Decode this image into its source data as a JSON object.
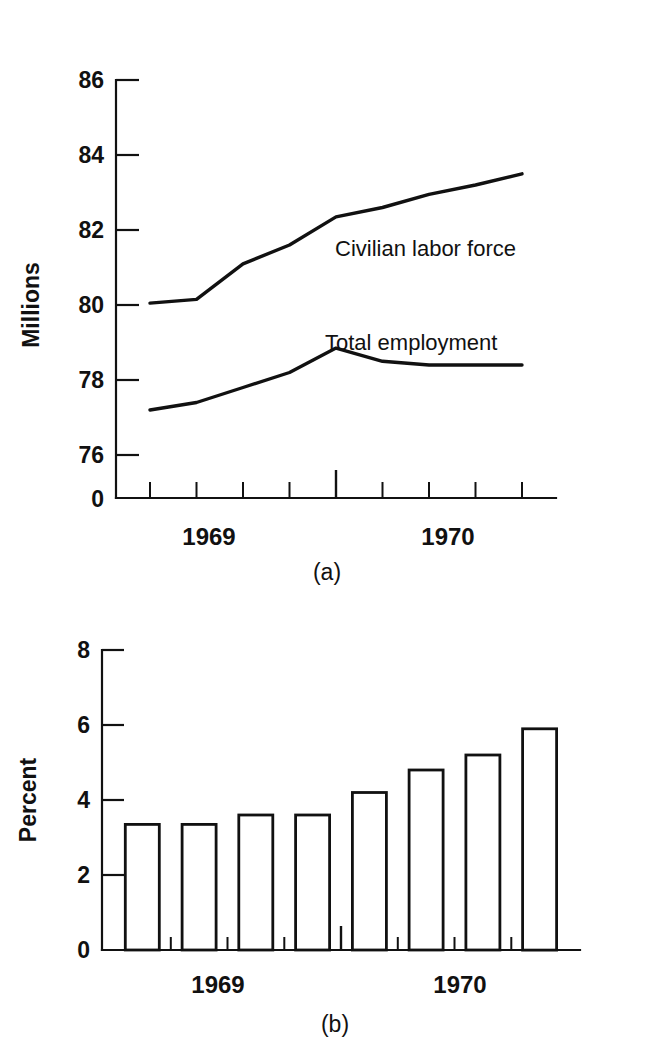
{
  "figure": {
    "background": "#ffffff",
    "ink_color": "#111111"
  },
  "panel_a": {
    "caption": "(a)",
    "ylabel": "Millions",
    "ytick_labels": [
      "86",
      "84",
      "82",
      "80",
      "78",
      "76",
      "0"
    ],
    "xtick_labels": [
      "1969",
      "1970"
    ],
    "series_labels": {
      "civilian": "Civilian labor force",
      "employment": "Total employment"
    }
  },
  "panel_b": {
    "caption": "(b)",
    "ylabel": "Percent",
    "ytick_labels": [
      "8",
      "6",
      "4",
      "2",
      "0"
    ],
    "xtick_labels": [
      "1969",
      "1970"
    ]
  },
  "chart_data": [
    {
      "type": "line",
      "panel": "(a)",
      "title": "",
      "xlabel": "",
      "ylabel": "Millions",
      "ylim": [
        75.3,
        86
      ],
      "yticks": [
        76,
        78,
        80,
        82,
        84,
        86
      ],
      "axis_break": true,
      "axis_break_label": "0",
      "grid": false,
      "legend": "inline-labels",
      "x_tick_years": [
        "1969",
        "1970"
      ],
      "x": [
        0,
        1,
        2,
        3,
        4,
        5,
        6,
        7,
        8
      ],
      "series": [
        {
          "name": "Civilian labor force",
          "values": [
            80.05,
            80.15,
            81.1,
            81.6,
            82.35,
            82.6,
            82.95,
            83.2,
            83.5
          ]
        },
        {
          "name": "Total employment",
          "values": [
            77.2,
            77.4,
            77.8,
            78.2,
            78.85,
            78.5,
            78.4,
            78.4,
            78.4
          ]
        }
      ]
    },
    {
      "type": "bar",
      "panel": "(b)",
      "title": "",
      "xlabel": "",
      "ylabel": "Percent",
      "ylim": [
        0,
        8
      ],
      "yticks": [
        0,
        2,
        4,
        6,
        8
      ],
      "grid": false,
      "x_tick_years": [
        "1969",
        "1970"
      ],
      "categories": [
        "1",
        "2",
        "3",
        "4",
        "5",
        "6",
        "7",
        "8"
      ],
      "values": [
        3.35,
        3.35,
        3.6,
        3.6,
        4.2,
        4.8,
        5.2,
        5.9
      ]
    }
  ]
}
